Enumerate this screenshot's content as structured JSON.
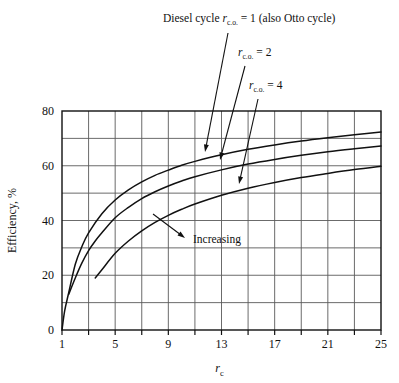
{
  "figure": {
    "name": "thermal-efficiency-vs-compression-ratio"
  },
  "annotations": {
    "label_top": {
      "prefix": "Diesel cycle ",
      "symbol": "r",
      "subscript": "c.o.",
      "equals": "= 1 (also Otto cycle)"
    },
    "label_mid": {
      "symbol": "r",
      "subscript": "c.o.",
      "equals": "= 2"
    },
    "label_low": {
      "symbol": "r",
      "subscript": "c.o.",
      "equals": "= 4"
    },
    "increasing": "Increasing"
  },
  "axes": {
    "xlabel_symbol": "r",
    "xlabel_subscript": "c",
    "ylabel": "Efficiency, %",
    "x_tick_labels": [
      "1",
      "5",
      "9",
      "13",
      "17",
      "21",
      "25"
    ],
    "y_tick_labels": [
      "0",
      "20",
      "40",
      "60",
      "80"
    ]
  },
  "chart_data": {
    "type": "line",
    "title": "",
    "subtitle": "",
    "xlabel": "r_c",
    "ylabel": "Efficiency, %",
    "xlim": [
      1,
      25
    ],
    "ylim": [
      0,
      80
    ],
    "x_ticks": [
      1,
      5,
      9,
      13,
      17,
      21,
      25
    ],
    "x_minor_gridlines": [
      1,
      3,
      5,
      7,
      9,
      11,
      13,
      15,
      17,
      19,
      21,
      23,
      25
    ],
    "y_ticks": [
      0,
      20,
      40,
      60,
      80
    ],
    "y_minor_gridlines": [
      0,
      10,
      20,
      30,
      40,
      50,
      60,
      70,
      80
    ],
    "grid": true,
    "legend": "none",
    "annotations": [
      {
        "text": "Diesel cycle r_c.o. = 1 (also Otto cycle)",
        "points_to_series": "r_c.o. = 1 (Otto)"
      },
      {
        "text": "r_c.o. = 2",
        "points_to_series": "r_c.o. = 2"
      },
      {
        "text": "r_c.o. = 4",
        "points_to_series": "r_c.o. = 4"
      },
      {
        "text": "Increasing",
        "points_to_series": "r_c.o. = 1 (Otto)"
      }
    ],
    "series": [
      {
        "name": "r_c.o. = 1 (Otto)",
        "x": [
          1,
          1.2,
          1.5,
          2,
          2.5,
          3,
          4,
          5,
          6,
          7,
          8,
          9,
          10,
          11,
          13,
          15,
          17,
          19,
          21,
          23,
          25
        ],
        "values": [
          0,
          7,
          13.5,
          24,
          30.5,
          35.5,
          42.5,
          47.5,
          51.2,
          54.1,
          56.5,
          58.4,
          60.2,
          61.6,
          64.0,
          66.0,
          67.6,
          69.0,
          70.2,
          71.3,
          72.3
        ]
      },
      {
        "name": "r_c.o. = 2",
        "x": [
          1.5,
          2,
          2.5,
          3,
          3.5,
          4,
          5,
          6,
          7,
          8,
          9,
          10,
          11,
          13,
          15,
          17,
          19,
          21,
          23,
          25
        ],
        "values": [
          13.0,
          19.0,
          24.5,
          29.0,
          32.5,
          35.5,
          41.0,
          44.8,
          48.0,
          50.5,
          52.6,
          54.4,
          56.0,
          58.5,
          60.6,
          62.3,
          63.8,
          65.1,
          66.2,
          67.2
        ]
      },
      {
        "name": "r_c.o. = 4",
        "x": [
          3.5,
          4,
          5,
          6,
          7,
          8,
          9,
          10,
          11,
          13,
          15,
          17,
          19,
          21,
          23,
          25
        ],
        "values": [
          19.0,
          22.0,
          28.0,
          32.5,
          36.2,
          39.3,
          41.9,
          44.1,
          46.0,
          49.2,
          51.8,
          53.9,
          55.7,
          57.2,
          58.6,
          59.8
        ]
      }
    ]
  }
}
